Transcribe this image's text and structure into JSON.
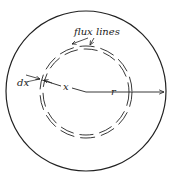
{
  "diagram": {
    "labels": {
      "flux_lines": "flux lines",
      "dx": "dx",
      "x": "x",
      "r": "r"
    },
    "colors": {
      "stroke": "#222222",
      "background": "#ffffff"
    },
    "geometry": {
      "outer_circle": {
        "cx": 86,
        "cy": 91,
        "r": 80
      },
      "flux_ring": {
        "cx": 86,
        "cy": 92,
        "r_inner": 43,
        "r_outer": 46
      }
    }
  }
}
